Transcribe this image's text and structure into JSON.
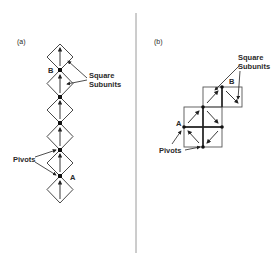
{
  "figure": {
    "panel_a": {
      "label": "(a)",
      "point_b": "B",
      "point_a": "A",
      "callout_subunits_line1": "Square",
      "callout_subunits_line2": "Subunits",
      "callout_pivots": "Pivots",
      "diamond_count": 6,
      "arrow_direction": "up"
    },
    "panel_b": {
      "label": "(b)",
      "point_b": "B",
      "point_a": "A",
      "callout_subunits_line1": "Square",
      "callout_subunits_line2": "Subunits",
      "callout_pivots": "Pivots",
      "square_count": 6,
      "arrow_directions": [
        "up-right",
        "down-right",
        "up-left",
        "down-left",
        "up-right",
        "down-right"
      ]
    },
    "colors": {
      "line": "#333333",
      "divider": "#9a9a9a",
      "background": "#ffffff"
    }
  }
}
